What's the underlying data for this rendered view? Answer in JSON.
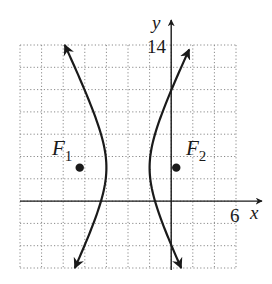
{
  "chart_data": {
    "type": "line",
    "title": "",
    "xlabel": "x",
    "ylabel": "y",
    "xlim": [
      -14,
      6
    ],
    "ylim": [
      -6,
      14
    ],
    "grid": true,
    "grid_step": 2,
    "grid_style": "dotted",
    "tick_labels": {
      "x": [
        "6"
      ],
      "y": [
        "14"
      ]
    },
    "curve": {
      "kind": "hyperbola",
      "equation": "(x+4)^2/4 - (y-3)^2/16 = 1",
      "center": [
        -4,
        3
      ],
      "a": 2,
      "b": 4,
      "orientation": "horizontal",
      "vertices": [
        [
          -6,
          3
        ],
        [
          -2,
          3
        ]
      ],
      "branches": [
        {
          "name": "left",
          "from": [
            -10,
            14
          ],
          "to": [
            -8.5,
            -6
          ]
        },
        {
          "name": "right",
          "from": [
            1.7,
            14
          ],
          "to": [
            0.5,
            -6
          ]
        }
      ]
    },
    "points": [
      {
        "label": "F1",
        "x": -8.47,
        "y": 3
      },
      {
        "label": "F2",
        "x": 0.47,
        "y": 3
      }
    ],
    "annotations": [
      "F1",
      "F2"
    ]
  },
  "labels": {
    "y_axis": "y",
    "x_axis": "x",
    "y_tick": "14",
    "x_tick": "6",
    "f1_main": "F",
    "f1_sub": "1",
    "f2_main": "F",
    "f2_sub": "2"
  },
  "colors": {
    "ink": "#1a1a1a",
    "grid": "#8a8a8a",
    "background": "#ffffff"
  }
}
